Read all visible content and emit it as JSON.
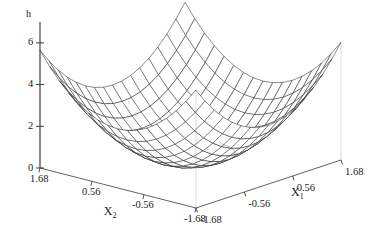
{
  "figure": {
    "background_color": "#ffffff",
    "mesh_color": "#2b2b2b",
    "axis_color": "#3a3a3a",
    "rim_tint_color": "#3d5c3d"
  },
  "axes": {
    "vertical": {
      "name": "h",
      "ticks": [
        "0",
        "2",
        "4",
        "6"
      ],
      "tick_values": [
        0,
        2,
        4,
        6
      ],
      "range": [
        0,
        7
      ]
    },
    "x1": {
      "name": "X",
      "subscript": "1",
      "ticks": [
        "-1.68",
        "-0.56",
        "0.56",
        "1.68"
      ],
      "tick_values": [
        -1.68,
        -0.56,
        0.56,
        1.68
      ],
      "range": [
        -1.68,
        1.68
      ]
    },
    "x2": {
      "name": "X",
      "subscript": "2",
      "ticks": [
        "1.68",
        "0.56",
        "-0.56",
        "-1.68"
      ],
      "tick_values": [
        1.68,
        0.56,
        -0.56,
        -1.68
      ],
      "range": [
        -1.68,
        1.68
      ]
    }
  },
  "chart_data": {
    "type": "surface",
    "title": "",
    "xlabel": "X_1",
    "ylabel": "X_2",
    "zlabel": "h",
    "grid": false,
    "legend": "none",
    "function": "h = x1^2 + x2^2",
    "projection": "3d-wireframe",
    "mesh_divisions": 16,
    "xlim": [
      -1.68,
      1.68
    ],
    "ylim": [
      -1.68,
      1.68
    ],
    "zlim": [
      0,
      7
    ],
    "zticks": [
      0,
      2,
      4,
      6
    ],
    "xticks": [
      -1.68,
      -0.56,
      0.56,
      1.68
    ],
    "yticks": [
      1.68,
      0.56,
      -0.56,
      -1.68
    ],
    "notable_points": [
      {
        "label": "minimum",
        "x1": 0,
        "x2": 0,
        "h": 0
      },
      {
        "label": "back-corner-peak",
        "x1": -1.68,
        "x2": 1.68,
        "h": 4.0
      },
      {
        "label": "left-corner",
        "x1": 1.68,
        "x2": 1.68,
        "h": 2.1
      },
      {
        "label": "right-corner",
        "x1": -1.68,
        "x2": -1.68,
        "h": 2.1
      },
      {
        "label": "front-corner",
        "x1": 1.68,
        "x2": -1.68,
        "h": 0.0
      }
    ],
    "sampled_surface": {
      "x": [
        -1.68,
        -1.12,
        -0.56,
        0.0,
        0.56,
        1.12,
        1.68
      ],
      "y": [
        -1.68,
        -1.12,
        -0.56,
        0.0,
        0.56,
        1.12,
        1.68
      ],
      "z": [
        [
          5.64,
          4.08,
          3.13,
          2.82,
          3.13,
          4.08,
          5.64
        ],
        [
          4.08,
          2.51,
          1.57,
          1.25,
          1.57,
          2.51,
          4.08
        ],
        [
          3.13,
          1.57,
          0.63,
          0.31,
          0.63,
          1.57,
          3.13
        ],
        [
          2.82,
          1.25,
          0.31,
          0.0,
          0.31,
          1.25,
          2.82
        ],
        [
          3.13,
          1.57,
          0.63,
          0.31,
          0.63,
          1.57,
          3.13
        ],
        [
          4.08,
          2.51,
          1.57,
          1.25,
          1.57,
          2.51,
          4.08
        ],
        [
          5.64,
          4.08,
          3.13,
          2.82,
          3.13,
          4.08,
          5.64
        ]
      ]
    }
  }
}
